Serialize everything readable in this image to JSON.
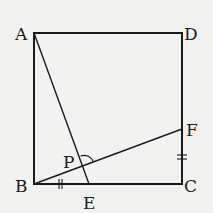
{
  "diagram": {
    "type": "geometry",
    "shape": "square ABCD",
    "points": {
      "A": {
        "label": "A",
        "x": 34,
        "y": 33
      },
      "B": {
        "label": "B",
        "x": 34,
        "y": 184
      },
      "C": {
        "label": "C",
        "x": 182,
        "y": 184
      },
      "D": {
        "label": "D",
        "x": 182,
        "y": 33
      },
      "E": {
        "label": "E",
        "x": 89,
        "y": 184
      },
      "F": {
        "label": "F",
        "x": 182,
        "y": 129
      },
      "P": {
        "label": "P",
        "x": 83,
        "y": 166
      }
    },
    "segments": [
      "AB",
      "BC",
      "CD",
      "DA",
      "AE",
      "BF"
    ],
    "equal_marks": [
      {
        "segment": "BE",
        "mark": "double-tick"
      },
      {
        "segment": "CF",
        "mark": "double-tick"
      }
    ],
    "angle_marks": [
      {
        "vertex": "P",
        "between": [
          "PA",
          "PF"
        ],
        "mark": "arc"
      }
    ],
    "colors": {
      "background": "#f2f2f0",
      "stroke": "#1a1a1a"
    }
  }
}
